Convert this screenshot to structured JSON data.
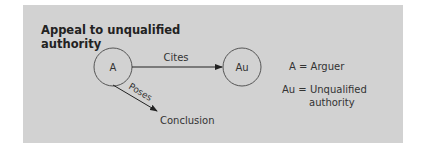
{
  "title": "Appeal to unqualified authority",
  "nodes": {
    "arguer": "A",
    "authority": "Au",
    "conclusion": "Conclusion"
  },
  "edges": {
    "cites": "Cites",
    "poses": "Poses"
  },
  "legend": {
    "a": "A = Arguer",
    "au_line1": "Au = Unqualified",
    "au_line2": "authority"
  },
  "colors": {
    "panel": "#d2d2d2",
    "stroke": "#333333"
  }
}
